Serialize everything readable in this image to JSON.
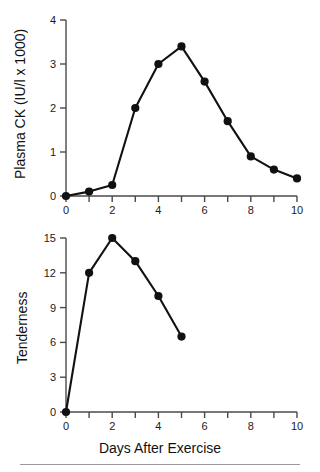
{
  "figure": {
    "background_color": "#ffffff",
    "line_color": "#111111",
    "marker_color": "#111111",
    "axis_color": "#4a4a4a",
    "rule_color": "#9a9a9a",
    "xlabel": "Days After Exercise",
    "footer_rule": "horizontal-rule"
  },
  "chart_data": [
    {
      "type": "line",
      "title": "",
      "panel": "top",
      "xlabel": "Days After Exercise",
      "ylabel": "Plasma CK (IU/l x 1000)",
      "xlim": [
        0,
        10
      ],
      "ylim": [
        0,
        4
      ],
      "xticks": [
        0,
        1,
        2,
        3,
        4,
        5,
        6,
        7,
        8,
        9,
        10
      ],
      "xticklabels": [
        "0",
        "",
        "2",
        "",
        "4",
        "",
        "6",
        "",
        "8",
        "",
        "10"
      ],
      "yticks": [
        0,
        1,
        2,
        3,
        4
      ],
      "yticklabels": [
        "0",
        "1",
        "2",
        "3",
        "4"
      ],
      "grid": false,
      "legend": false,
      "marker": "filled-circle",
      "x": [
        0,
        1,
        2,
        3,
        4,
        5,
        6,
        7,
        8,
        9,
        10
      ],
      "values": [
        0,
        0.1,
        0.25,
        2.0,
        3.0,
        3.4,
        2.6,
        1.7,
        0.9,
        0.6,
        0.4
      ]
    },
    {
      "type": "line",
      "title": "",
      "panel": "bottom",
      "xlabel": "Days After Exercise",
      "ylabel": "Tenderness",
      "xlim": [
        0,
        10
      ],
      "ylim": [
        0,
        15
      ],
      "xticks": [
        0,
        1,
        2,
        3,
        4,
        5,
        6,
        7,
        8,
        9,
        10
      ],
      "xticklabels": [
        "0",
        "",
        "2",
        "",
        "4",
        "",
        "6",
        "",
        "8",
        "",
        "10"
      ],
      "yticks": [
        0,
        3,
        6,
        9,
        12,
        15
      ],
      "yticklabels": [
        "0",
        "3",
        "6",
        "9",
        "12",
        "15"
      ],
      "grid": false,
      "legend": false,
      "marker": "filled-circle",
      "x": [
        0,
        1,
        2,
        3,
        4,
        5
      ],
      "values": [
        0,
        12,
        15,
        13,
        10,
        6.5
      ]
    }
  ]
}
